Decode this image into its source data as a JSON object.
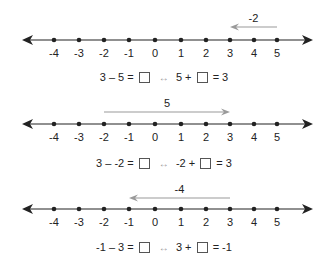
{
  "colors": {
    "axis": "#222222",
    "jump_arrow": "#9a9a9a",
    "text": "#222222"
  },
  "tick_values": [
    "-4",
    "-3",
    "-2",
    "-1",
    "0",
    "1",
    "2",
    "3",
    "4",
    "5"
  ],
  "problems": [
    {
      "jump_label": "-2",
      "jump_from": 5,
      "jump_to": 3,
      "equation": {
        "left": "3 – 5 =",
        "arrow": "↔",
        "right_a": "5 +",
        "right_b": "= 3"
      }
    },
    {
      "jump_label": "5",
      "jump_from": -2,
      "jump_to": 3,
      "equation": {
        "left": "3 – -2 =",
        "arrow": "↔",
        "right_a": "-2 +",
        "right_b": "= 3"
      }
    },
    {
      "jump_label": "-4",
      "jump_from": 3,
      "jump_to": -1,
      "equation": {
        "left": "-1 – 3 =",
        "arrow": "↔",
        "right_a": "3 +",
        "right_b": "= -1"
      }
    }
  ]
}
